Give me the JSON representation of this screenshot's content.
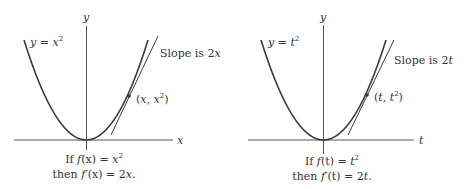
{
  "diagrams": [
    {
      "id": "left",
      "axis_x_label": "x",
      "axis_y_label": "y",
      "curve_label": {
        "lhs": "y = ",
        "var": "x",
        "exp": "2"
      },
      "slope_label": {
        "text": "Slope is 2",
        "var": "x"
      },
      "point_label": {
        "open": "(",
        "a": "x",
        "sep": ", ",
        "b": "x",
        "exp": "2",
        "close": ")"
      },
      "caption_line1": {
        "prefix": "If ",
        "f": "f",
        "arg": "(x)",
        "eq": " = ",
        "rhs": "x",
        "exp": "2"
      },
      "caption_line2": {
        "prefix": "then ",
        "f": "f′",
        "arg": "(x)",
        "eq": " = 2",
        "rhs": "x",
        "end": "."
      }
    },
    {
      "id": "right",
      "axis_x_label": "t",
      "axis_y_label": "y",
      "curve_label": {
        "lhs": "y = ",
        "var": "t",
        "exp": "2"
      },
      "slope_label": {
        "text": "Slope is 2",
        "var": "t"
      },
      "point_label": {
        "open": "(",
        "a": "t",
        "sep": ", ",
        "b": "t",
        "exp": "2",
        "close": ")"
      },
      "caption_line1": {
        "prefix": "If ",
        "f": "f",
        "arg": "(t)",
        "eq": " = ",
        "rhs": "t",
        "exp": "2"
      },
      "caption_line2": {
        "prefix": "then ",
        "f": "f′",
        "arg": "(t)",
        "eq": " = 2",
        "rhs": "t",
        "end": "."
      }
    }
  ],
  "colors": {
    "curve": "#3a3a3a",
    "axis": "#555555",
    "text": "#333333"
  }
}
